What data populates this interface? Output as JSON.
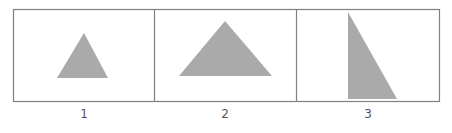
{
  "figure": {
    "panels": [
      {
        "label": "1",
        "shape": "triangle",
        "points": "84,33 108,78 57,78"
      },
      {
        "label": "2",
        "shape": "triangle",
        "points": "225,21 272,76 179,76"
      },
      {
        "label": "3",
        "shape": "triangle",
        "points": "348,12 397,99 348,99"
      }
    ],
    "colors": {
      "fill": "#aaaaaa",
      "border": "#777777"
    }
  }
}
